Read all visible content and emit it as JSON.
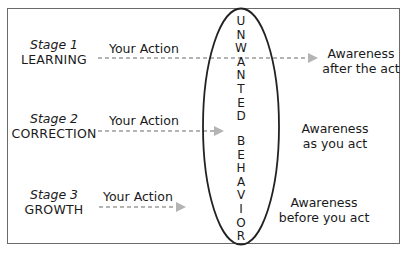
{
  "diagram": {
    "type": "awareness-stages",
    "central_label": {
      "word1": [
        "U",
        "N",
        "W",
        "A",
        "N",
        "T",
        "E",
        "D"
      ],
      "word2": [
        "B",
        "E",
        "H",
        "A",
        "V",
        "I",
        "O",
        "R"
      ],
      "full_text": "UNWANTED BEHAVIOR"
    },
    "stages": [
      {
        "stage_number": "Stage 1",
        "stage_name": "LEARNING",
        "action_label": "Your Action",
        "awareness_line1": "Awareness",
        "awareness_line2": "after the act",
        "arrow_extent": "past-ellipse"
      },
      {
        "stage_number": "Stage 2",
        "stage_name": "CORRECTION",
        "action_label": "Your Action",
        "awareness_line1": "Awareness",
        "awareness_line2": "as you act",
        "arrow_extent": "into-ellipse"
      },
      {
        "stage_number": "Stage 3",
        "stage_name": "GROWTH",
        "action_label": "Your Action",
        "awareness_line1": "Awareness",
        "awareness_line2": "before you act",
        "arrow_extent": "before-ellipse"
      }
    ],
    "colors": {
      "border": "#6a6a6a",
      "ellipse": "#222222",
      "arrow": "#b4b4b4",
      "text": "#1a1a1a"
    }
  }
}
